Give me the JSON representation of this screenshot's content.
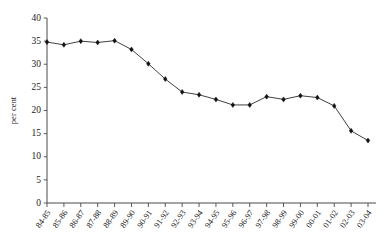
{
  "chart_data": {
    "type": "line",
    "title": "",
    "xlabel": "",
    "ylabel": "per cent",
    "ylim": [
      0,
      40
    ],
    "ytick_step": 5,
    "grid": false,
    "legend": null,
    "categories": [
      "84-85",
      "85-86",
      "86-87",
      "87-88",
      "88-89",
      "89-90",
      "90-91",
      "91-92",
      "92-93",
      "93-94",
      "94-95",
      "95-96",
      "96-97",
      "97-98",
      "98-99",
      "99-00",
      "00-01",
      "01-02",
      "02-03",
      "03-04"
    ],
    "values": [
      34.8,
      34.2,
      35.0,
      34.7,
      35.1,
      33.2,
      30.1,
      26.8,
      24.0,
      23.4,
      22.4,
      21.2,
      21.2,
      23.0,
      22.4,
      23.2,
      22.8,
      21.0,
      15.6,
      13.5
    ],
    "yticks": [
      "0",
      "5",
      "10",
      "15",
      "20",
      "25",
      "30",
      "35",
      "40"
    ],
    "ytick_values": [
      0,
      5,
      10,
      15,
      20,
      25,
      30,
      35,
      40
    ],
    "marker": "diamond",
    "series_color": "#2b2b2b"
  }
}
